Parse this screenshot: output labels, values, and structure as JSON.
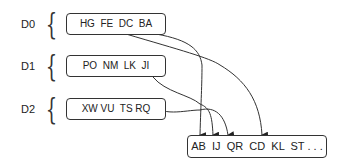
{
  "levels": [
    {
      "label": "D0",
      "box": "HG  FE  DC  BA"
    },
    {
      "label": "D1",
      "box": "PO  NM  LK  JI"
    },
    {
      "label": "D2",
      "box": "XW VU  TS RQ"
    }
  ],
  "output": {
    "box": "AB  IJ  QR  CD  KL  ST . . ."
  },
  "brace_glyph": "{"
}
